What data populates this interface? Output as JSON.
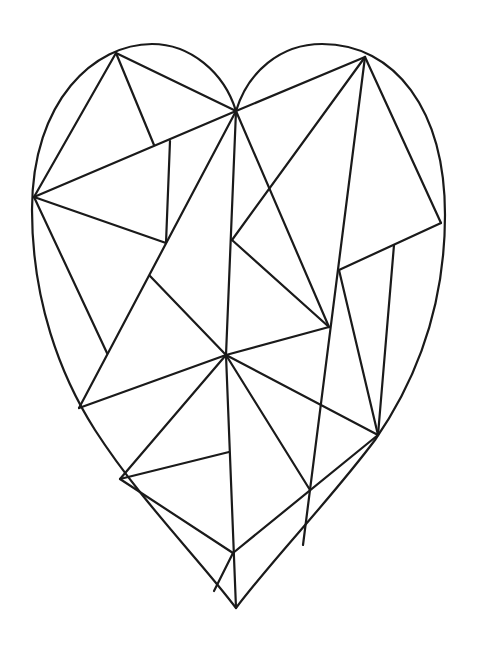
{
  "artwork": {
    "subject": "geometric faceted heart line drawing",
    "stroke_color": "#1a1a1a",
    "background_color": "#ffffff",
    "outline_path": "M236,111 C224,72 190,44 152,44 C95,44 32,100 32,210 C32,300 60,375 95,430 C140,500 200,560 236,608 C272,560 330,500 375,440 C420,375 445,300 445,215 C445,110 395,44 322,44 C280,44 248,72 236,111 Z",
    "facets": [
      {
        "x1": 116,
        "y1": 53,
        "x2": 236,
        "y2": 111
      },
      {
        "x1": 116,
        "y1": 53,
        "x2": 34,
        "y2": 197
      },
      {
        "x1": 116,
        "y1": 53,
        "x2": 154,
        "y2": 145
      },
      {
        "x1": 34,
        "y1": 197,
        "x2": 236,
        "y2": 111
      },
      {
        "x1": 34,
        "y1": 197,
        "x2": 166,
        "y2": 243
      },
      {
        "x1": 34,
        "y1": 197,
        "x2": 107,
        "y2": 353
      },
      {
        "x1": 170,
        "y1": 141,
        "x2": 166,
        "y2": 243
      },
      {
        "x1": 236,
        "y1": 111,
        "x2": 365,
        "y2": 57
      },
      {
        "x1": 236,
        "y1": 111,
        "x2": 79,
        "y2": 408
      },
      {
        "x1": 236,
        "y1": 111,
        "x2": 226,
        "y2": 355
      },
      {
        "x1": 236,
        "y1": 111,
        "x2": 329,
        "y2": 327
      },
      {
        "x1": 365,
        "y1": 57,
        "x2": 232,
        "y2": 240
      },
      {
        "x1": 365,
        "y1": 57,
        "x2": 303,
        "y2": 545
      },
      {
        "x1": 365,
        "y1": 57,
        "x2": 441,
        "y2": 223
      },
      {
        "x1": 441,
        "y1": 223,
        "x2": 339,
        "y2": 270
      },
      {
        "x1": 394,
        "y1": 245,
        "x2": 378,
        "y2": 435
      },
      {
        "x1": 339,
        "y1": 270,
        "x2": 378,
        "y2": 435
      },
      {
        "x1": 232,
        "y1": 240,
        "x2": 329,
        "y2": 327
      },
      {
        "x1": 329,
        "y1": 327,
        "x2": 226,
        "y2": 355
      },
      {
        "x1": 150,
        "y1": 276,
        "x2": 226,
        "y2": 355
      },
      {
        "x1": 79,
        "y1": 408,
        "x2": 226,
        "y2": 355
      },
      {
        "x1": 226,
        "y1": 355,
        "x2": 378,
        "y2": 435
      },
      {
        "x1": 226,
        "y1": 355,
        "x2": 120,
        "y2": 479
      },
      {
        "x1": 226,
        "y1": 355,
        "x2": 310,
        "y2": 490
      },
      {
        "x1": 226,
        "y1": 355,
        "x2": 236,
        "y2": 608
      },
      {
        "x1": 120,
        "y1": 479,
        "x2": 229,
        "y2": 452
      },
      {
        "x1": 120,
        "y1": 479,
        "x2": 233,
        "y2": 553
      },
      {
        "x1": 378,
        "y1": 435,
        "x2": 233,
        "y2": 553
      },
      {
        "x1": 233,
        "y1": 553,
        "x2": 214,
        "y2": 591
      }
    ]
  }
}
